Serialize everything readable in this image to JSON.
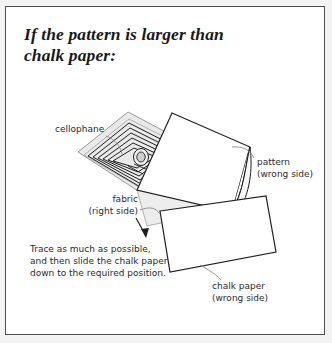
{
  "page": {
    "background_color": "#f3f3f3",
    "frame_color": "#4d4d4d",
    "paper_color": "#ffffff"
  },
  "heading": {
    "line1": "If the pattern is larger than",
    "line2": "chalk paper:"
  },
  "labels": {
    "cellophane": "cellophane",
    "pattern": "pattern\n(wrong side)",
    "fabric": "fabric\n(right side)",
    "chalk_paper": "chalk paper\n(wrong side)"
  },
  "instructions": {
    "text": "Trace as much as possible, and then slide the chalk paper down to the required position."
  },
  "diagram": {
    "ink_color": "#1f1f1f",
    "leader_color": "#8a8a8a",
    "cellophane_fill": "#e6e6e6",
    "fabric_fill": "#ededed",
    "pattern_fill": "#ffffff",
    "chalk_fill": "#ffffff",
    "arrow_label": "slide-direction-arrow"
  }
}
